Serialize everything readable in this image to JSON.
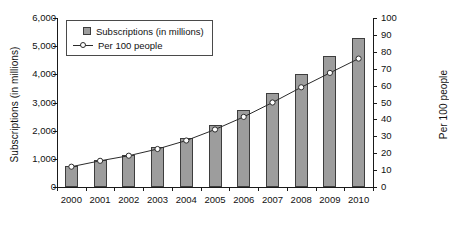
{
  "chart_data": {
    "type": "bar",
    "title": "",
    "subtitle": "",
    "xlabel": "",
    "ylabel": "Subscriptions (in millions)",
    "y2label": "Per 100 people",
    "grid": false,
    "legend_position": "top-left",
    "categories": [
      "2000",
      "2001",
      "2002",
      "2003",
      "2004",
      "2005",
      "2006",
      "2007",
      "2008",
      "2009",
      "2010"
    ],
    "ylim": [
      0,
      6000
    ],
    "y2lim": [
      0,
      100
    ],
    "yticks": [
      "0",
      "1,000",
      "2,000",
      "3,000",
      "4,000",
      "5,000",
      "6,000"
    ],
    "ytick_values": [
      0,
      1000,
      2000,
      3000,
      4000,
      5000,
      6000
    ],
    "y2ticks": [
      "0",
      "10",
      "20",
      "30",
      "40",
      "50",
      "60",
      "70",
      "80",
      "90",
      "100"
    ],
    "y2tick_values": [
      0,
      10,
      20,
      30,
      40,
      50,
      60,
      70,
      80,
      90,
      100
    ],
    "series": [
      {
        "name": "Subscriptions (in millions)",
        "type": "bar",
        "axis": "left",
        "color": "#9d9d9d",
        "edge_color": "#3d3d3d",
        "values": [
          740,
          955,
          1140,
          1410,
          1740,
          2200,
          2750,
          3350,
          4010,
          4650,
          5280
        ]
      },
      {
        "name": "Per 100 people",
        "type": "line",
        "axis": "right",
        "color": "#2b2b2b",
        "marker": "open-circle",
        "values": [
          12,
          15.5,
          18.5,
          22.5,
          27.5,
          34,
          41.5,
          50,
          59,
          67.5,
          76
        ]
      }
    ]
  },
  "legend": {
    "items": [
      {
        "label": "Subscriptions (in millions)",
        "marker": "square-swatch"
      },
      {
        "label": "Per 100 people",
        "marker": "line-circle-swatch"
      }
    ]
  }
}
